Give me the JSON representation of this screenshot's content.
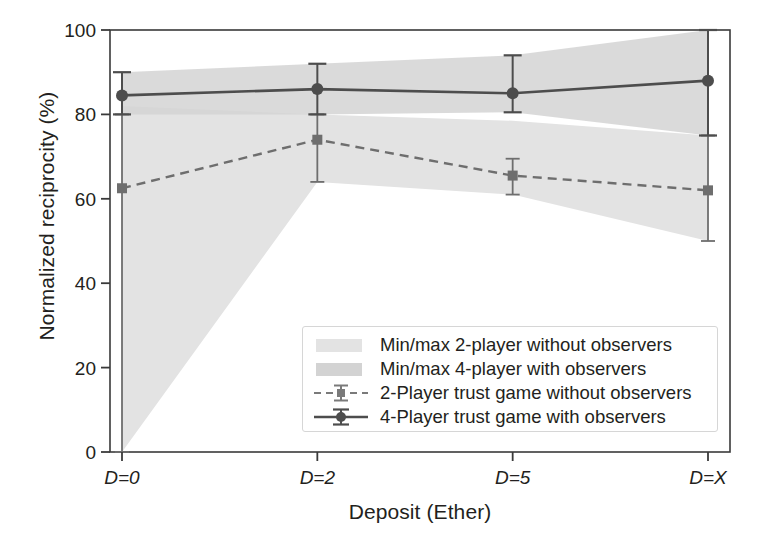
{
  "chart_data": {
    "type": "line",
    "title": "",
    "xlabel": "Deposit (Ether)",
    "ylabel": "Normalized reciprocity (%)",
    "categories": [
      "D=0",
      "D=2",
      "D=5",
      "D=X"
    ],
    "xtick_labels": [
      "D=0",
      "D=2",
      "D=5",
      "D=X"
    ],
    "ytick_labels": [
      "0",
      "20",
      "40",
      "60",
      "80",
      "100"
    ],
    "yticks": [
      0,
      20,
      40,
      60,
      80,
      100
    ],
    "ylim": [
      0,
      100
    ],
    "grid": false,
    "legend_position": "lower-center-right",
    "series": [
      {
        "name": "2-Player trust game without observers",
        "style": "dashed",
        "marker": "square",
        "color": "#6e6e6e",
        "values": [
          62.5,
          74.0,
          65.5,
          62.0
        ],
        "err_low": [
          0.0,
          64.0,
          61.0,
          50.0
        ],
        "err_high": [
          80.0,
          80.0,
          69.5,
          75.0
        ]
      },
      {
        "name": "4-Player trust game with observers",
        "style": "solid",
        "marker": "circle",
        "color": "#4d4d4d",
        "values": [
          84.5,
          86.0,
          85.0,
          88.0
        ],
        "err_low": [
          80.0,
          80.0,
          80.5,
          75.0
        ],
        "err_high": [
          90.0,
          92.0,
          94.0,
          100.0
        ]
      }
    ],
    "bands": [
      {
        "name": "Min/max 2-player without observers",
        "color": "#e3e3e3",
        "lower": [
          0.0,
          64.0,
          61.0,
          50.0
        ],
        "upper": [
          82.0,
          80.0,
          78.5,
          75.0
        ]
      },
      {
        "name": "Min/max 4-player with observers",
        "color": "#d3d3d3",
        "lower": [
          80.0,
          80.0,
          80.5,
          75.0
        ],
        "upper": [
          90.0,
          92.0,
          94.0,
          100.0
        ]
      }
    ],
    "legend_entries": [
      {
        "label": "Min/max 2-player without observers",
        "kind": "band",
        "color": "#e3e3e3"
      },
      {
        "label": "Min/max 4-player with observers",
        "kind": "band",
        "color": "#d3d3d3"
      },
      {
        "label": "2-Player trust game without observers",
        "kind": "dashed-square",
        "color": "#6e6e6e"
      },
      {
        "label": "4-Player trust game with observers",
        "kind": "solid-circle",
        "color": "#4d4d4d"
      }
    ]
  }
}
